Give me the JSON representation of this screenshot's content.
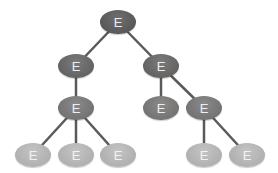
{
  "diagram": {
    "type": "tree",
    "node_label": "E",
    "edge_color": "#5a5a5a",
    "nodes": [
      {
        "id": "n0",
        "label": "E",
        "level": 0,
        "x": 118,
        "y": 22
      },
      {
        "id": "n1",
        "label": "E",
        "level": 1,
        "x": 76,
        "y": 66
      },
      {
        "id": "n2",
        "label": "E",
        "level": 1,
        "x": 161,
        "y": 66
      },
      {
        "id": "n3",
        "label": "E",
        "level": 2,
        "x": 76,
        "y": 108
      },
      {
        "id": "n4",
        "label": "E",
        "level": 2,
        "x": 161,
        "y": 108
      },
      {
        "id": "n5",
        "label": "E",
        "level": 2,
        "x": 204,
        "y": 108
      },
      {
        "id": "n6",
        "label": "E",
        "level": 3,
        "x": 33,
        "y": 155
      },
      {
        "id": "n7",
        "label": "E",
        "level": 3,
        "x": 76,
        "y": 155
      },
      {
        "id": "n8",
        "label": "E",
        "level": 3,
        "x": 118,
        "y": 155
      },
      {
        "id": "n9",
        "label": "E",
        "level": 3,
        "x": 204,
        "y": 155
      },
      {
        "id": "n10",
        "label": "E",
        "level": 3,
        "x": 247,
        "y": 155
      }
    ],
    "edges": [
      [
        "n0",
        "n1"
      ],
      [
        "n0",
        "n2"
      ],
      [
        "n1",
        "n3"
      ],
      [
        "n2",
        "n4"
      ],
      [
        "n2",
        "n5"
      ],
      [
        "n3",
        "n6"
      ],
      [
        "n3",
        "n7"
      ],
      [
        "n3",
        "n8"
      ],
      [
        "n5",
        "n9"
      ],
      [
        "n5",
        "n10"
      ]
    ]
  }
}
